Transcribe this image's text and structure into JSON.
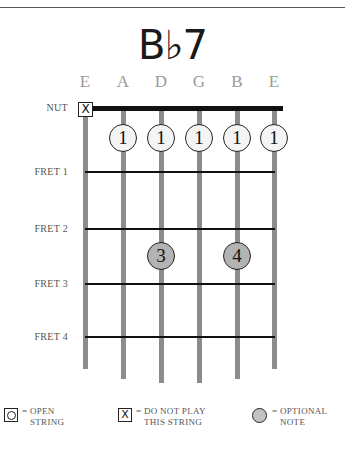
{
  "chord": {
    "name": "B♭7"
  },
  "strings": [
    "E",
    "A",
    "D",
    "G",
    "B",
    "E"
  ],
  "nut_label": "NUT",
  "frets": [
    "FRET 1",
    "FRET 2",
    "FRET 3",
    "FRET 4"
  ],
  "string_markers": {
    "string_1": "X"
  },
  "fingers": [
    {
      "string": "A",
      "fret": 1,
      "finger": "1"
    },
    {
      "string": "D",
      "fret": 1,
      "finger": "1"
    },
    {
      "string": "G",
      "fret": 1,
      "finger": "1"
    },
    {
      "string": "B",
      "fret": 1,
      "finger": "1"
    },
    {
      "string": "E",
      "fret": 1,
      "finger": "1"
    },
    {
      "string": "D",
      "fret": 3,
      "finger": "3"
    },
    {
      "string": "B",
      "fret": 3,
      "finger": "4"
    }
  ],
  "legend": {
    "open": {
      "symbol": "O",
      "line1": "= OPEN",
      "line2": "STRING"
    },
    "mute": {
      "symbol": "X",
      "line1": "= DO NOT PLAY",
      "line2": "THIS STRING"
    },
    "optional": {
      "line1": "= OPTIONAL",
      "line2": "NOTE"
    }
  },
  "colors": {
    "string": "#8c8c8c",
    "fret": "#111111",
    "optional_fill": "#b3b3b3",
    "finger_fill": "#f4f4f4"
  }
}
